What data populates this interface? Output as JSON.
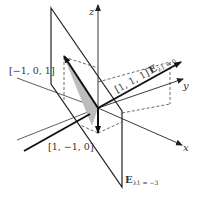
{
  "diagram": {
    "axes": {
      "x": "x",
      "y": "y",
      "z": "z"
    },
    "vectors": {
      "v111": "[1, 1, 1]",
      "vm101": "[−1, 0, 1]",
      "v1m10": "[1, −1, 0]"
    },
    "eigenspaces": {
      "e0_main": "E",
      "e0_sub": "λ1 = 0",
      "em3_main": "E",
      "em3_sub": "λ1 = −3"
    },
    "colors": {
      "line": "#111111",
      "thin": "#333333",
      "dash": "#444444",
      "shade": "#bdbdbd",
      "text": "#333333"
    }
  }
}
